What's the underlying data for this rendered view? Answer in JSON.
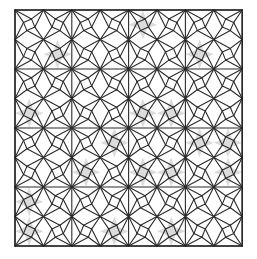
{
  "figure": {
    "title": "",
    "canvas": {
      "width": 257,
      "height": 259
    },
    "origin": {
      "x": 15,
      "y": 10
    },
    "cell": {
      "w": 28.4,
      "h": 29.5
    },
    "cols": 8,
    "rows": 8,
    "colors": {
      "line": "#2b2b2b",
      "shade": "#dcdcdc",
      "background": "#ffffff"
    },
    "shaded_stars": [
      {
        "col": 0,
        "row": 3
      },
      {
        "col": 1,
        "row": 1
      },
      {
        "col": 3,
        "row": 4
      },
      {
        "col": 4,
        "row": 3
      },
      {
        "col": 5,
        "row": 3
      },
      {
        "col": 6,
        "row": 1
      },
      {
        "col": 6,
        "row": 4
      },
      {
        "col": 7,
        "row": 4
      },
      {
        "col": 2,
        "row": 5
      },
      {
        "col": 4,
        "row": 5
      },
      {
        "col": 5,
        "row": 5
      },
      {
        "col": 7,
        "row": 5
      },
      {
        "col": 0,
        "row": 7
      },
      {
        "col": 3,
        "row": 7
      },
      {
        "col": 5,
        "row": 7
      },
      {
        "col": 4,
        "row": 0
      },
      {
        "col": 0,
        "row": 6
      }
    ]
  }
}
